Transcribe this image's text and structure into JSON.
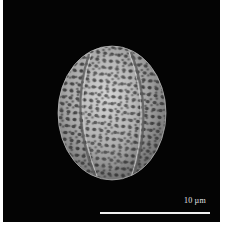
{
  "image": {
    "subject": "pollen grain (SEM micrograph)",
    "background_color": "#040404",
    "frame_color": "#ffffff",
    "grain_color": "#a8a8a8",
    "grain_highlight": "#d0d0d0",
    "lumina_color": "#2a2a2a"
  },
  "scale_bar": {
    "label": "10 µm",
    "color": "#f0f0f0"
  }
}
